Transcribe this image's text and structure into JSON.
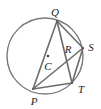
{
  "diagram": {
    "type": "circle-geometry",
    "stroke_color": "#6b6b6b",
    "circle": {
      "cx": 45,
      "cy": 56,
      "r": 38
    },
    "center": {
      "label": "C",
      "x": 48,
      "y": 56,
      "label_x": 48,
      "label_y": 66
    },
    "points": [
      {
        "label": "Q",
        "x": 57,
        "y": 21,
        "label_x": 55,
        "label_y": 12
      },
      {
        "label": "S",
        "x": 83,
        "y": 48,
        "label_x": 91,
        "label_y": 47
      },
      {
        "label": "T",
        "x": 72,
        "y": 83,
        "label_x": 81,
        "label_y": 89
      },
      {
        "label": "P",
        "x": 33,
        "y": 89,
        "label_x": 34,
        "label_y": 101
      }
    ],
    "intersection": {
      "label": "R",
      "label_x": 68,
      "label_y": 49
    },
    "segments": [
      [
        "Q",
        "P"
      ],
      [
        "Q",
        "T"
      ],
      [
        "Q",
        "S"
      ],
      [
        "S",
        "T"
      ],
      [
        "P",
        "S"
      ],
      [
        "P",
        "T"
      ]
    ]
  }
}
